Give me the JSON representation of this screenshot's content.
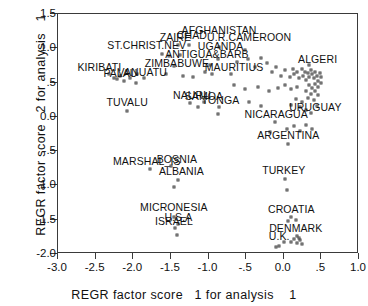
{
  "chart_data": {
    "type": "scatter",
    "title": "",
    "xlabel": "REGR factor score   1 for analysis    1",
    "ylabel": "REGR factor score   2 for analysis   1",
    "xlim": [
      -3.0,
      1.0
    ],
    "ylim": [
      -2.0,
      1.5
    ],
    "grid": false,
    "legend": "none",
    "xticks": [
      "-3.0",
      "-2.5",
      "-2.0",
      "-1.5",
      "-1.0",
      "-.5",
      "0.0",
      ".5",
      "1.0"
    ],
    "xtickvals": [
      -3.0,
      -2.5,
      -2.0,
      -1.5,
      -1.0,
      -0.5,
      0.0,
      0.5,
      1.0
    ],
    "yticks": [
      "1.5",
      "1.0",
      ".5",
      "0.0",
      "-.5",
      "-1.0",
      "-1.5",
      "-2.0"
    ],
    "ytickvals": [
      1.5,
      1.0,
      0.5,
      0.0,
      -0.5,
      -1.0,
      -1.5,
      -2.0
    ],
    "labeled_points": [
      {
        "label": "ZAIRE",
        "x": -1.4,
        "y": 1.05,
        "lx": -1.44,
        "ly": 1.17
      },
      {
        "label": "CHAD",
        "x": -1.26,
        "y": 1.05,
        "lx": -1.22,
        "ly": 1.19
      },
      {
        "label": "ST.CHRIST.NEV",
        "x": -1.62,
        "y": 0.92,
        "lx": -1.82,
        "ly": 1.05
      },
      {
        "label": "AFGHANISTAN",
        "x": -0.86,
        "y": 1.02,
        "lx": -0.86,
        "ly": 1.26
      },
      {
        "label": "U.R.CAMEROON",
        "x": -0.52,
        "y": 0.98,
        "lx": -0.46,
        "ly": 1.16
      },
      {
        "label": "UGANDA",
        "x": -0.88,
        "y": 0.84,
        "lx": -0.84,
        "ly": 1.03
      },
      {
        "label": "ANTIGUA&BARB",
        "x": -0.98,
        "y": 0.76,
        "lx": -1.02,
        "ly": 0.92
      },
      {
        "label": "KIRIBATI",
        "x": -2.32,
        "y": 0.62,
        "lx": -2.45,
        "ly": 0.72
      },
      {
        "label": "PALAU",
        "x": -2.18,
        "y": 0.6,
        "lx": -2.17,
        "ly": 0.64
      },
      {
        "label": "VANUATU",
        "x": -1.95,
        "y": 0.62,
        "lx": -1.88,
        "ly": 0.65
      },
      {
        "label": "ZIMBABUWE",
        "x": -1.46,
        "y": 0.74,
        "lx": -1.42,
        "ly": 0.78
      },
      {
        "label": "MAURITIUS",
        "x": -0.7,
        "y": 0.62,
        "lx": -0.66,
        "ly": 0.72
      },
      {
        "label": "ALGERI",
        "x": 0.34,
        "y": 0.76,
        "lx": 0.45,
        "ly": 0.84
      },
      {
        "label": "TUVALU",
        "x": -2.08,
        "y": 0.08,
        "lx": -2.08,
        "ly": 0.22
      },
      {
        "label": "NAURU",
        "x": -1.24,
        "y": 0.2,
        "lx": -1.22,
        "ly": 0.32
      },
      {
        "label": "SAMOA",
        "x": -1.06,
        "y": 0.22,
        "lx": -1.06,
        "ly": 0.31
      },
      {
        "label": "TONGA",
        "x": -0.86,
        "y": 0.14,
        "lx": -0.84,
        "ly": 0.25
      },
      {
        "label": "URUGUAY",
        "x": 0.36,
        "y": 0.05,
        "lx": 0.42,
        "ly": 0.14
      },
      {
        "label": "NICARAGUA",
        "x": -0.12,
        "y": -0.08,
        "lx": -0.1,
        "ly": 0.04
      },
      {
        "label": "ARGENTINA",
        "x": 0.06,
        "y": -0.4,
        "lx": 0.06,
        "ly": -0.26
      },
      {
        "label": "MARSHAL_IS",
        "x": -1.78,
        "y": -0.76,
        "lx": -1.82,
        "ly": -0.64
      },
      {
        "label": "BOSNIA",
        "x": -1.5,
        "y": -0.72,
        "lx": -1.42,
        "ly": -0.62
      },
      {
        "label": "ALBANIA",
        "x": -1.4,
        "y": -0.92,
        "lx": -1.36,
        "ly": -0.79
      },
      {
        "label": "TURKEY",
        "x": 0.02,
        "y": -0.9,
        "lx": 0.0,
        "ly": -0.78
      },
      {
        "label": "MICRONESIA",
        "x": -1.46,
        "y": -1.46,
        "lx": -1.46,
        "ly": -1.32
      },
      {
        "label": "U.S.A",
        "x": -1.4,
        "y": -1.56,
        "lx": -1.4,
        "ly": -1.46
      },
      {
        "label": "ISRAEL",
        "x": -1.44,
        "y": -1.62,
        "lx": -1.46,
        "ly": -1.52
      },
      {
        "label": "CROATIA",
        "x": 0.1,
        "y": -1.46,
        "lx": 0.1,
        "ly": -1.35
      },
      {
        "label": "DENMARK",
        "x": 0.18,
        "y": -1.74,
        "lx": 0.16,
        "ly": -1.62
      },
      {
        "label": "U.K.",
        "x": 0.0,
        "y": -1.82,
        "lx": -0.06,
        "ly": -1.74
      }
    ],
    "unlabeled_points": [
      {
        "x": -1.52,
        "y": 0.89
      },
      {
        "x": -1.38,
        "y": 0.9
      },
      {
        "x": -2.26,
        "y": 0.57
      },
      {
        "x": -2.22,
        "y": 0.55
      },
      {
        "x": -2.12,
        "y": 0.52
      },
      {
        "x": -2.04,
        "y": 0.56
      },
      {
        "x": -1.96,
        "y": 0.5
      },
      {
        "x": -1.86,
        "y": 0.57
      },
      {
        "x": -1.56,
        "y": 0.62
      },
      {
        "x": -1.34,
        "y": 0.6
      },
      {
        "x": -1.2,
        "y": 0.58
      },
      {
        "x": -1.04,
        "y": 0.66
      },
      {
        "x": -0.96,
        "y": 0.62
      },
      {
        "x": -0.62,
        "y": 0.8
      },
      {
        "x": -0.48,
        "y": 0.84
      },
      {
        "x": -0.38,
        "y": 0.72
      },
      {
        "x": -0.3,
        "y": 0.86
      },
      {
        "x": -0.22,
        "y": 0.78
      },
      {
        "x": -0.16,
        "y": 0.66
      },
      {
        "x": -0.1,
        "y": 0.72
      },
      {
        "x": -0.04,
        "y": 0.6
      },
      {
        "x": 0.02,
        "y": 0.68
      },
      {
        "x": 0.08,
        "y": 0.58
      },
      {
        "x": 0.12,
        "y": 0.7
      },
      {
        "x": 0.14,
        "y": 0.62
      },
      {
        "x": 0.18,
        "y": 0.66
      },
      {
        "x": 0.2,
        "y": 0.56
      },
      {
        "x": 0.24,
        "y": 0.7
      },
      {
        "x": 0.26,
        "y": 0.6
      },
      {
        "x": 0.28,
        "y": 0.66
      },
      {
        "x": 0.3,
        "y": 0.54
      },
      {
        "x": 0.32,
        "y": 0.64
      },
      {
        "x": 0.34,
        "y": 0.58
      },
      {
        "x": 0.36,
        "y": 0.68
      },
      {
        "x": 0.38,
        "y": 0.62
      },
      {
        "x": 0.4,
        "y": 0.56
      },
      {
        "x": 0.42,
        "y": 0.66
      },
      {
        "x": 0.44,
        "y": 0.6
      },
      {
        "x": 0.46,
        "y": 0.52
      },
      {
        "x": 0.48,
        "y": 0.64
      },
      {
        "x": 0.5,
        "y": 0.58
      },
      {
        "x": 0.33,
        "y": 0.46
      },
      {
        "x": 0.37,
        "y": 0.42
      },
      {
        "x": 0.41,
        "y": 0.48
      },
      {
        "x": 0.45,
        "y": 0.44
      },
      {
        "x": 0.49,
        "y": 0.5
      },
      {
        "x": 0.3,
        "y": 0.38
      },
      {
        "x": 0.36,
        "y": 0.34
      },
      {
        "x": 0.42,
        "y": 0.38
      },
      {
        "x": 0.46,
        "y": 0.32
      },
      {
        "x": 0.18,
        "y": 0.44
      },
      {
        "x": 0.1,
        "y": 0.4
      },
      {
        "x": 0.02,
        "y": 0.46
      },
      {
        "x": -0.08,
        "y": 0.42
      },
      {
        "x": -0.2,
        "y": 0.38
      },
      {
        "x": -0.34,
        "y": 0.44
      },
      {
        "x": -0.52,
        "y": 0.4
      },
      {
        "x": -0.66,
        "y": 0.46
      },
      {
        "x": 0.16,
        "y": 0.26
      },
      {
        "x": 0.24,
        "y": 0.22
      },
      {
        "x": 0.32,
        "y": 0.28
      },
      {
        "x": 0.4,
        "y": 0.24
      },
      {
        "x": 0.1,
        "y": 0.18
      },
      {
        "x": 0.22,
        "y": 0.14
      },
      {
        "x": 0.3,
        "y": 0.1
      },
      {
        "x": 0.44,
        "y": 0.16
      },
      {
        "x": -0.46,
        "y": 0.22
      },
      {
        "x": -0.3,
        "y": 0.16
      },
      {
        "x": -1.14,
        "y": 0.14
      },
      {
        "x": -0.88,
        "y": 0.04
      },
      {
        "x": 0.04,
        "y": -0.18
      },
      {
        "x": 0.14,
        "y": -0.14
      },
      {
        "x": 0.22,
        "y": -0.2
      },
      {
        "x": 0.3,
        "y": -0.12
      },
      {
        "x": 0.38,
        "y": -0.18
      },
      {
        "x": -0.18,
        "y": -0.22
      },
      {
        "x": -1.46,
        "y": -1.02
      },
      {
        "x": 0.04,
        "y": -1.06
      },
      {
        "x": 0.06,
        "y": -1.52
      },
      {
        "x": 0.16,
        "y": -1.5
      },
      {
        "x": 0.1,
        "y": -1.82
      },
      {
        "x": 0.14,
        "y": -1.78
      },
      {
        "x": 0.18,
        "y": -1.84
      },
      {
        "x": 0.22,
        "y": -1.8
      },
      {
        "x": 0.2,
        "y": -1.76
      },
      {
        "x": 0.24,
        "y": -1.86
      },
      {
        "x": -0.1,
        "y": -1.9
      },
      {
        "x": -0.06,
        "y": -1.88
      },
      {
        "x": -1.42,
        "y": -1.72
      }
    ]
  }
}
